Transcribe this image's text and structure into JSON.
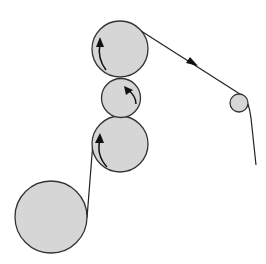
{
  "diagram": {
    "type": "roller-web-path",
    "colors": {
      "roller_fill": "#d6d6d6",
      "roller_stroke": "#333333",
      "web_line": "#222222",
      "arrow": "#111111"
    },
    "rollers": [
      {
        "id": "top-roller",
        "cx": 120,
        "cy": 49,
        "r": 28,
        "rotation": "counterclockwise"
      },
      {
        "id": "middle-small-roller",
        "cx": 121,
        "cy": 98,
        "r": 20,
        "rotation": "clockwise"
      },
      {
        "id": "lower-roller",
        "cx": 120,
        "cy": 144,
        "r": 28,
        "rotation": "counterclockwise"
      },
      {
        "id": "supply-roller",
        "cx": 51,
        "cy": 217,
        "r": 36,
        "rotation": "none"
      },
      {
        "id": "idler-roller",
        "cx": 239,
        "cy": 103,
        "r": 9,
        "rotation": "none"
      }
    ],
    "web_direction": "from supply roller up through nip rollers, then right to idler, then down"
  }
}
